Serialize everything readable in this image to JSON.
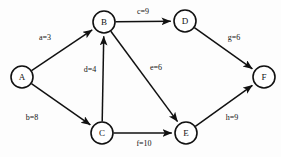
{
  "figure": {
    "type": "directed-weighted-graph",
    "background_color": "#fdfdfd",
    "stroke_color": "#111111",
    "node_fill": "#ffffff",
    "width": 281,
    "height": 157
  },
  "nodes": [
    {
      "id": "A",
      "label": "A",
      "cx": 22,
      "cy": 77,
      "r": 11
    },
    {
      "id": "B",
      "label": "B",
      "cx": 104,
      "cy": 22,
      "r": 11
    },
    {
      "id": "C",
      "label": "C",
      "cx": 102,
      "cy": 133,
      "r": 11
    },
    {
      "id": "D",
      "label": "D",
      "cx": 185,
      "cy": 21,
      "r": 11
    },
    {
      "id": "E",
      "label": "E",
      "cx": 186,
      "cy": 133,
      "r": 11
    },
    {
      "id": "F",
      "label": "F",
      "cx": 264,
      "cy": 77,
      "r": 11
    }
  ],
  "edges": [
    {
      "id": "a",
      "from": "A",
      "to": "B",
      "name": "a",
      "weight": 3,
      "label": "a=3",
      "lx": 45,
      "ly": 38
    },
    {
      "id": "b",
      "from": "A",
      "to": "C",
      "name": "b",
      "weight": 8,
      "label": "b=8",
      "lx": 32,
      "ly": 118
    },
    {
      "id": "c",
      "from": "B",
      "to": "D",
      "name": "c",
      "weight": 9,
      "label": "c=9",
      "lx": 143,
      "ly": 12
    },
    {
      "id": "d",
      "from": "C",
      "to": "B",
      "name": "d",
      "weight": 4,
      "label": "d=4",
      "lx": 90,
      "ly": 70
    },
    {
      "id": "e",
      "from": "B",
      "to": "E",
      "name": "e",
      "weight": 6,
      "label": "e=6",
      "lx": 156,
      "ly": 68
    },
    {
      "id": "f",
      "from": "C",
      "to": "E",
      "name": "f",
      "weight": 10,
      "label": "f=10",
      "lx": 144,
      "ly": 144
    },
    {
      "id": "g",
      "from": "D",
      "to": "F",
      "name": "g",
      "weight": 6,
      "label": "g=6",
      "lx": 234,
      "ly": 38
    },
    {
      "id": "h",
      "from": "E",
      "to": "F",
      "name": "h",
      "weight": 9,
      "label": "h=9",
      "lx": 232,
      "ly": 118
    }
  ],
  "chart_data": {
    "type": "diagram",
    "title": "",
    "nodes": [
      "A",
      "B",
      "C",
      "D",
      "E",
      "F"
    ],
    "edges": [
      {
        "from": "A",
        "to": "B",
        "name": "a",
        "weight": 3
      },
      {
        "from": "A",
        "to": "C",
        "name": "b",
        "weight": 8
      },
      {
        "from": "B",
        "to": "D",
        "name": "c",
        "weight": 9
      },
      {
        "from": "C",
        "to": "B",
        "name": "d",
        "weight": 4
      },
      {
        "from": "B",
        "to": "E",
        "name": "e",
        "weight": 6
      },
      {
        "from": "C",
        "to": "E",
        "name": "f",
        "weight": 10
      },
      {
        "from": "D",
        "to": "F",
        "name": "g",
        "weight": 6
      },
      {
        "from": "E",
        "to": "F",
        "name": "h",
        "weight": 9
      }
    ],
    "directed": true,
    "weighted": true
  }
}
